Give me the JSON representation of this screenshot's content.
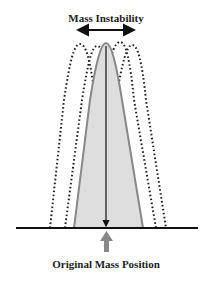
{
  "diagram": {
    "title": "Mass Instability",
    "caption": "Original Mass Position",
    "colors": {
      "mass_fill": "#dedede",
      "mass_stroke": "#888888",
      "dotted_outline": "#222222",
      "baseline": "#111111",
      "arrow_up": "#888888"
    },
    "elements": {
      "instability_arrow": "double-headed horizontal arrow",
      "displaced_outlines": 4,
      "center_axis": "vertical line with arrowhead at base"
    }
  }
}
